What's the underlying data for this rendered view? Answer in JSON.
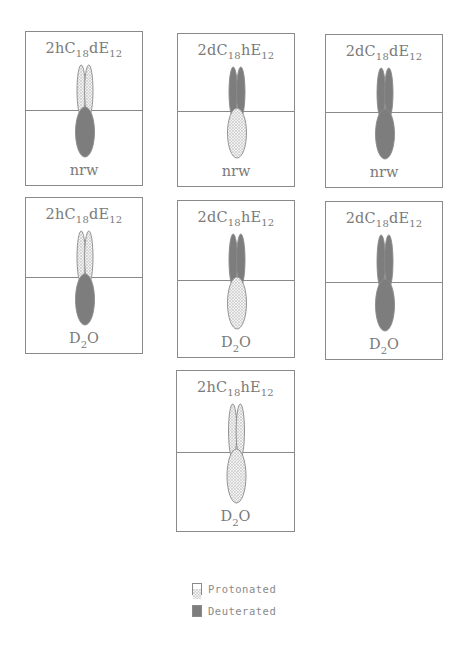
{
  "figure": {
    "panels": [
      {
        "id": "p1",
        "title_main": "2hC",
        "title_sub1": "18",
        "title_mid": "dE",
        "title_sub2": "12",
        "tail": "protonated",
        "head": "deuterated",
        "medium_main": "nrw",
        "medium_sub": "",
        "medium_tail": "",
        "box": {
          "x": 25,
          "y": 31,
          "w": 118,
          "h": 155
        }
      },
      {
        "id": "p2",
        "title_main": "2dC",
        "title_sub1": "18",
        "title_mid": "hE",
        "title_sub2": "12",
        "tail": "deuterated",
        "head": "protonated",
        "medium_main": "nrw",
        "medium_sub": "",
        "medium_tail": "",
        "box": {
          "x": 177,
          "y": 33,
          "w": 118,
          "h": 154
        }
      },
      {
        "id": "p3",
        "title_main": "2dC",
        "title_sub1": "18",
        "title_mid": "dE",
        "title_sub2": "12",
        "tail": "deuterated",
        "head": "deuterated",
        "medium_main": "nrw",
        "medium_sub": "",
        "medium_tail": "",
        "box": {
          "x": 325,
          "y": 34,
          "w": 118,
          "h": 154
        }
      },
      {
        "id": "p4",
        "title_main": "2hC",
        "title_sub1": "18",
        "title_mid": "dE",
        "title_sub2": "12",
        "tail": "protonated",
        "head": "deuterated",
        "medium_main": "D",
        "medium_sub": "2",
        "medium_tail": "O",
        "box": {
          "x": 25,
          "y": 197,
          "w": 118,
          "h": 157
        }
      },
      {
        "id": "p5",
        "title_main": "2dC",
        "title_sub1": "18",
        "title_mid": "hE",
        "title_sub2": "12",
        "tail": "deuterated",
        "head": "protonated",
        "medium_main": "D",
        "medium_sub": "2",
        "medium_tail": "O",
        "box": {
          "x": 177,
          "y": 200,
          "w": 118,
          "h": 158
        }
      },
      {
        "id": "p6",
        "title_main": "2dC",
        "title_sub1": "18",
        "title_mid": "dE",
        "title_sub2": "12",
        "tail": "deuterated",
        "head": "deuterated",
        "medium_main": "D",
        "medium_sub": "2",
        "medium_tail": "O",
        "box": {
          "x": 325,
          "y": 201,
          "w": 118,
          "h": 159
        }
      },
      {
        "id": "p7",
        "title_main": "2hC",
        "title_sub1": "18",
        "title_mid": "hE",
        "title_sub2": "12",
        "tail": "protonated",
        "head": "protonated",
        "medium_main": "D",
        "medium_sub": "2",
        "medium_tail": "O",
        "box": {
          "x": 176,
          "y": 370,
          "w": 119,
          "h": 162
        }
      }
    ],
    "legend": {
      "items": [
        {
          "label": "Protonated",
          "style": "protonated"
        },
        {
          "label": "Deuterated",
          "style": "deuterated"
        }
      ]
    },
    "colors": {
      "deuterated_fill": "#7d7d7d",
      "protonated_fill": "#ececec",
      "outline": "#8a8a8a",
      "text": "#7a7a7a"
    }
  }
}
